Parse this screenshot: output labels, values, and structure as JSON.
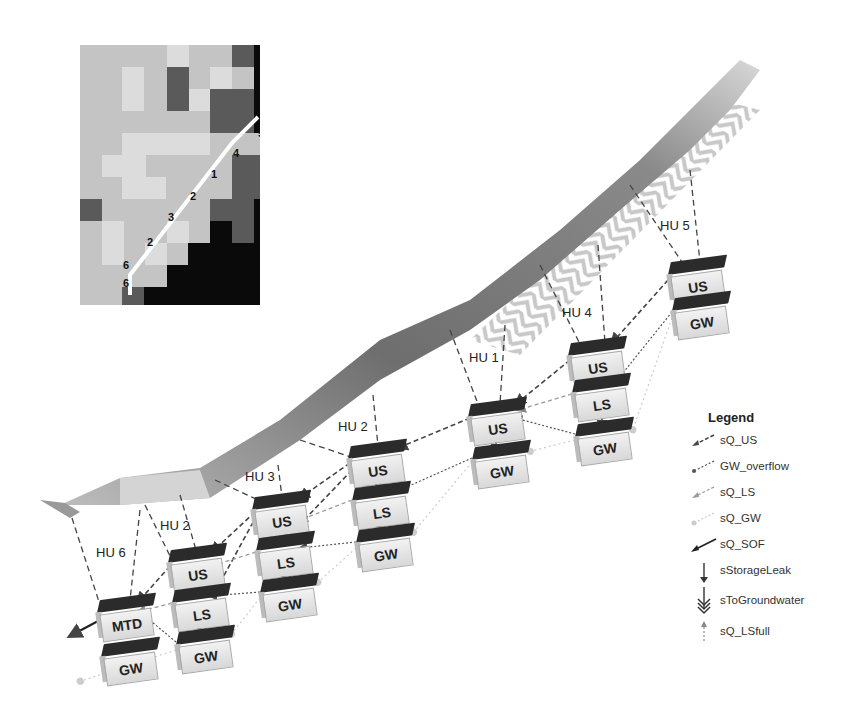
{
  "inset_map": {
    "grid_cols": 12,
    "grid_rows": 16,
    "labels": [
      {
        "text": "5",
        "x": 196,
        "y": 64
      },
      {
        "text": "5",
        "x": 178,
        "y": 90
      },
      {
        "text": "4",
        "x": 153,
        "y": 110
      },
      {
        "text": "1",
        "x": 131,
        "y": 131
      },
      {
        "text": "2",
        "x": 110,
        "y": 153
      },
      {
        "text": "3",
        "x": 88,
        "y": 174
      },
      {
        "text": "2",
        "x": 67,
        "y": 199
      },
      {
        "text": "6",
        "x": 43,
        "y": 222
      },
      {
        "text": "6",
        "x": 43,
        "y": 240
      }
    ]
  },
  "hydrologic_units": [
    {
      "label": "HU 5",
      "x": 660,
      "y": 226
    },
    {
      "label": "HU 4",
      "x": 562,
      "y": 313
    },
    {
      "label": "HU 1",
      "x": 469,
      "y": 358
    },
    {
      "label": "HU 2",
      "x": 338,
      "y": 427
    },
    {
      "label": "HU 3",
      "x": 245,
      "y": 477
    },
    {
      "label": "HU 2",
      "x": 160,
      "y": 526
    },
    {
      "label": "HU 6",
      "x": 96,
      "y": 553
    }
  ],
  "boxes": [
    {
      "id": "hu5-us",
      "label": "US",
      "x": 668,
      "y": 262
    },
    {
      "id": "hu5-gw",
      "label": "GW",
      "x": 672,
      "y": 298
    },
    {
      "id": "hu4-us",
      "label": "US",
      "x": 568,
      "y": 343
    },
    {
      "id": "hu4-ls",
      "label": "LS",
      "x": 572,
      "y": 380
    },
    {
      "id": "hu4-gw",
      "label": "GW",
      "x": 575,
      "y": 424
    },
    {
      "id": "hu1-us",
      "label": "US",
      "x": 468,
      "y": 404
    },
    {
      "id": "hu1-gw",
      "label": "GW",
      "x": 472,
      "y": 447
    },
    {
      "id": "hu2b-us",
      "label": "US",
      "x": 348,
      "y": 446
    },
    {
      "id": "hu2b-ls",
      "label": "LS",
      "x": 352,
      "y": 488
    },
    {
      "id": "hu2b-gw",
      "label": "GW",
      "x": 356,
      "y": 530
    },
    {
      "id": "hu3-us",
      "label": "US",
      "x": 252,
      "y": 497
    },
    {
      "id": "hu3-ls",
      "label": "LS",
      "x": 256,
      "y": 538
    },
    {
      "id": "hu3-gw",
      "label": "GW",
      "x": 260,
      "y": 580
    },
    {
      "id": "hu2a-us",
      "label": "US",
      "x": 168,
      "y": 550
    },
    {
      "id": "hu2a-ls",
      "label": "LS",
      "x": 172,
      "y": 590
    },
    {
      "id": "hu2a-gw",
      "label": "GW",
      "x": 176,
      "y": 632
    },
    {
      "id": "hu6-mtd",
      "label": "MTD",
      "x": 97,
      "y": 600
    },
    {
      "id": "hu6-gw",
      "label": "GW",
      "x": 101,
      "y": 644
    }
  ],
  "legend": {
    "title": "Legend",
    "items": [
      {
        "label": "sQ_US",
        "style": "dashed-dark-arrow"
      },
      {
        "label": "GW_overflow",
        "style": "dotted-dark-arrow"
      },
      {
        "label": "sQ_LS",
        "style": "dashed-gray-arrow"
      },
      {
        "label": "sQ_GW",
        "style": "dotted-light-arrow"
      },
      {
        "label": "sQ_SOF",
        "style": "solid-dark-arrow"
      },
      {
        "label": "sStorageLeak",
        "style": "solid-down-arrow"
      },
      {
        "label": "sToGroundwater",
        "style": "triple-chevron-down"
      },
      {
        "label": "sQ_LSfull",
        "style": "dotted-up-arrow"
      }
    ]
  },
  "colors": {
    "box_top": "#2b2b2b",
    "box_front": "#e6e6e6",
    "arrow_dark": "#444444",
    "arrow_gray": "#888888",
    "arrow_light": "#bbbbbb",
    "hatch": "#c8c8c8"
  }
}
